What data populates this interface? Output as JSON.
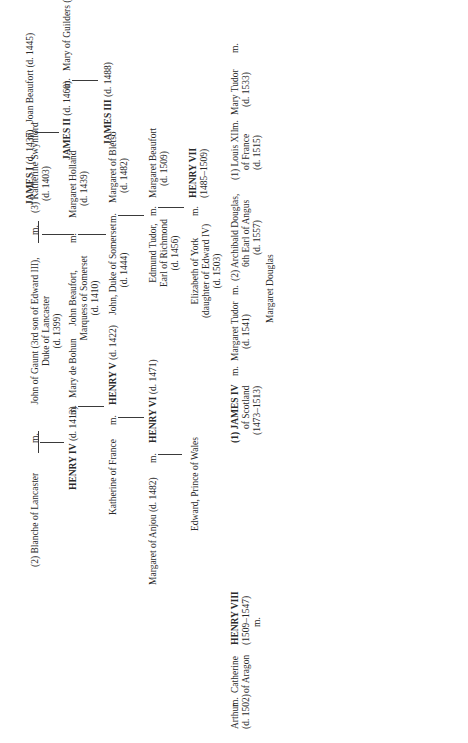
{
  "tree": {
    "lancaster": {
      "blanche": "(2) Blanche of Lancaster",
      "m1": "m.",
      "john_gaunt": "John of Gaunt (3rd son of Edward III),",
      "john_gaunt_2": "Duke of Lancaster",
      "john_gaunt_3": "(d. 1399)",
      "m2": "m.",
      "katherine_swynford": "(3) Katherine Swynford",
      "katherine_swynford_2": "(d. 1403)",
      "henry_iv": "HENRY IV",
      "henry_iv_d": "(d. 1413)",
      "m3": "m.",
      "mary_bohun": "Mary de Bohun",
      "john_beaufort": "John Beaufort,",
      "john_beaufort_2": "Marquess of Somerset",
      "john_beaufort_3": "(d. 1410)",
      "m4": "m.",
      "margaret_holland": "Margaret Holland",
      "margaret_holland_2": "(d. 1439)",
      "katherine_france": "Katherine of France",
      "m5": "m.",
      "henry_v": "HENRY V",
      "henry_v_d": "(d. 1422)",
      "john_somerset": "John, Duke of Somerset",
      "john_somerset_2": "(d. 1444)",
      "m6": "m.",
      "margaret_bletso": "Margaret of Bletso",
      "margaret_bletso_2": "(d. 1482)",
      "margaret_anjou": "Margaret of Anjou (d. 1482)",
      "m7": "m.",
      "henry_vi": "HENRY VI",
      "henry_vi_d": "(d. 1471)",
      "edmund_tudor": "Edmund Tudor,",
      "edmund_tudor_2": "Earl of Richmond",
      "edmund_tudor_3": "(d. 1456)",
      "m8": "m.",
      "margaret_beaufort": "Margaret Beaufort",
      "margaret_beaufort_2": "(d. 1509)",
      "edward_wales": "Edward, Prince of Wales",
      "elizabeth_york": "Elizabeth of York",
      "elizabeth_york_2": "(daughter of Edward IV)",
      "elizabeth_york_3": "(d. 1503)",
      "m9": "m.",
      "henry_vii": "HENRY VII",
      "henry_vii_d": "(1485–1509)"
    },
    "scotland": {
      "james_i": "JAMES I",
      "james_i_d": "(d. 1437)",
      "m1": "m.",
      "joan_beaufort": "Joan Beaufort (d. 1445)",
      "james_ii": "JAMES II",
      "james_ii_d": "(d. 1460)",
      "m2": "m.",
      "mary_guelders": "Mary of Guilders (d. 1463)",
      "james_iii": "JAMES III",
      "james_iii_d": "(d. 1488)",
      "m3": "m.",
      "margaret_denmark": "Margaret of Denmark (d. 1486)"
    },
    "tudor": {
      "arthur": "Arthur",
      "arthur_d": "(d. 1502)",
      "m_arthur": "m.",
      "catherine_a": "Catherine",
      "catherine_a_2": "of Aragon",
      "henry_viii": "HENRY VIII",
      "henry_viii_d": "(1509–1547)",
      "henry_viii_m": "m.",
      "james_iv": "(1) JAMES IV",
      "james_iv_2": "of Scotland",
      "james_iv_3": "(1473–1513)",
      "m_mt": "m.",
      "margaret_tudor": "Margaret Tudor",
      "margaret_tudor_d": "(d. 1541)",
      "m_mt2": "m.",
      "archibald": "(2) Archibald Douglas,",
      "archibald_2": "6th Earl of Angus",
      "archibald_3": "(d. 1557)",
      "margaret_douglas": "Margaret Douglas",
      "louis_xii": "(1) Louis XII",
      "louis_xii_2": "of France",
      "louis_xii_3": "(d. 1515)",
      "m_mary": "m.",
      "mary_tudor": "Mary Tudor",
      "mary_tudor_d": "(d. 1533)",
      "m_mary2": "m.",
      "charles_brandon": "(2) Charles Brandon,",
      "charles_brandon_2": "Duke of Suffolk",
      "charles_brandon_3": "(d. 1545)",
      "frances_brandon": "Frances Brandon",
      "frances_brandon_d": "(d. 1559)",
      "m_fb": "m.",
      "henry_grey": "Henry Grey,",
      "henry_grey_2": "Marquess of Dorset",
      "henry_grey_3": "and Duke of Suffolk",
      "henry_grey_4": "(d. 1554)",
      "jane_grey": "Jane Grey (decl. Queen",
      "jane_grey_2": "1553; ex. 1554)",
      "catherine_grey": "Catherine Grey",
      "catherine_grey_d": "(d. 1568)",
      "m_cg": "m.",
      "edward_seymour": "Edward Seymour,",
      "edward_seymour_2": "Earl of Hertford",
      "edward_seymour_3": "(d. 1621)"
    },
    "wives": [
      {
        "name": "(1) Catherine of Aragon",
        "dates": "(m. 1509–div. 1533–d. 1536)"
      },
      {
        "name": "(2) Anne Boleyn",
        "dates": "(m. 1533–ex. 1536)"
      },
      {
        "name": "(3) Jane Seymour",
        "dates": "(m. 1536–d. 1537)"
      },
      {
        "name": "(4) Anne of Cleves",
        "dates": "(m. 1540–div. 1541–d. 1557)"
      },
      {
        "name": "(5) Katherine Howard",
        "dates": "(m. 1541–ex. 1542)"
      },
      {
        "name": "(6) Catherine Parr",
        "dates": "(m. 1543–d. 1548)"
      }
    ],
    "children": {
      "mary_i": "MARY I",
      "mary_i_d": "(1553–1558)",
      "m_mary_i": "m.",
      "philip": "Philip II",
      "philip_2": "of Spain",
      "philip_3": "(d. 1598)",
      "elizabeth_i": "ELIZABETH I",
      "elizabeth_i_d": "(1558–1603)",
      "edward_vi": "EDWARD VI",
      "edward_vi_d": "(1547–1553)"
    },
    "stuart": {
      "madeleine": "(1) Madeleine",
      "madeleine_2": "of France",
      "madeleine_3": "(d. 1537)",
      "mary_guise": "(2) Mary of Guise",
      "mary_guise_d": "(d. 1560)",
      "m_j5": "m.",
      "james_v": "JAMES V of Scotland",
      "james_v_d": "(1513–1542)",
      "mary_qos": "MARY, Queen of Scots",
      "mary_qos_d": "(1542–68; ex. 1587)",
      "m_qos": "m.",
      "francis_ii": "(1) Francis II of France",
      "francis_ii_d": "(d. 1560)",
      "darnley": "(2) Henry, Lord Darnley",
      "darnley_d": "(d. 1567)",
      "bothwell": "(3) James, Earl of Bothwell",
      "bothwell_d": "(d. 1578)",
      "lennox_note": "the Lennox /",
      "lennox_note_2": "Darnley line"
    }
  }
}
